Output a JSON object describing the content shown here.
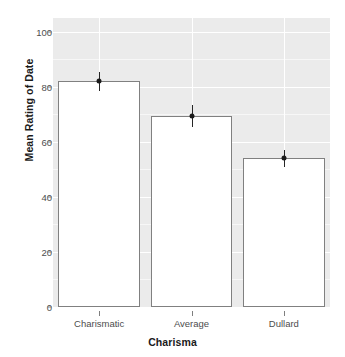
{
  "chart_data": {
    "type": "bar",
    "title": "",
    "subtitle": "",
    "xlabel": "Charisma",
    "ylabel": "Mean Rating of Date",
    "categories": [
      "Charismatic",
      "Average",
      "Dullard"
    ],
    "values": [
      82,
      69.5,
      54
    ],
    "errors": [
      3.5,
      4.0,
      3.0
    ],
    "series": [
      {
        "name": "Mean Rating of Date",
        "values": [
          82,
          69.5,
          54
        ],
        "errors": [
          3.5,
          4.0,
          3.0
        ]
      }
    ],
    "ylim": [
      0,
      105
    ],
    "xlim": [
      0,
      3
    ],
    "yticks": [
      0,
      20,
      40,
      60,
      80,
      100
    ],
    "ytick_labels": [
      "0",
      "20",
      "40",
      "60",
      "80",
      "100"
    ],
    "xtick_labels": [
      "Charismatic",
      "Average",
      "Dullard"
    ],
    "grid": true,
    "grid_major_color": "#ffffff",
    "grid_minor_color": "#f7f7f7",
    "legend": false,
    "legend_position": "none",
    "panel_background": "#ebebeb",
    "bar_fill": "#ffffff",
    "bar_border": "#808080",
    "error_bar_color": "#262626",
    "point_color": "#1a1a1a",
    "annotations": []
  },
  "axes": {
    "y": {
      "label": "Mean Rating of Date",
      "ticks": [
        {
          "value": 100,
          "label": "100"
        },
        {
          "value": 80,
          "label": "80"
        },
        {
          "value": 60,
          "label": "60"
        },
        {
          "value": 40,
          "label": "40"
        },
        {
          "value": 20,
          "label": "20"
        },
        {
          "value": 0,
          "label": "0"
        }
      ]
    },
    "x": {
      "label": "Charisma",
      "ticks": [
        {
          "index": 0,
          "label": "Charismatic"
        },
        {
          "index": 1,
          "label": "Average"
        },
        {
          "index": 2,
          "label": "Dullard"
        }
      ]
    }
  }
}
